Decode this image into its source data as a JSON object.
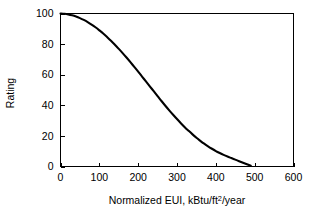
{
  "chart_data": {
    "type": "line",
    "title": "",
    "xlabel": "Normalized EUI, kBtu/ft2/year",
    "xlabel_main": "Normalized EUI, kBtu/ft",
    "xlabel_sup": "2",
    "xlabel_tail": "/year",
    "ylabel": "Rating",
    "xlim": [
      0,
      600
    ],
    "ylim": [
      0,
      100
    ],
    "xticks": [
      0,
      100,
      200,
      300,
      400,
      500,
      600
    ],
    "xtick_labels": [
      "0",
      "100",
      "200",
      "300",
      "400",
      "500",
      "600"
    ],
    "yticks": [
      0,
      20,
      40,
      60,
      80,
      100
    ],
    "ytick_labels": [
      "0",
      "20",
      "40",
      "60",
      "80",
      "100"
    ],
    "grid": false,
    "legend": false,
    "series": [
      {
        "name": "Rating vs Normalized EUI",
        "color": "#000000",
        "x": [
          0,
          10,
          20,
          30,
          40,
          50,
          60,
          70,
          80,
          90,
          100,
          110,
          120,
          130,
          140,
          150,
          160,
          170,
          180,
          190,
          200,
          210,
          220,
          230,
          240,
          250,
          260,
          270,
          280,
          290,
          300,
          310,
          320,
          330,
          340,
          350,
          360,
          370,
          380,
          390,
          400,
          410,
          420,
          430,
          440,
          450,
          460,
          470,
          480,
          490
        ],
        "values": [
          100,
          99.8,
          99.4,
          98.8,
          98.0,
          97.0,
          95.8,
          94.4,
          92.8,
          91.0,
          89.0,
          86.9,
          84.6,
          82.2,
          79.6,
          76.9,
          74.1,
          71.2,
          68.2,
          65.1,
          62.0,
          58.8,
          55.6,
          52.4,
          49.2,
          46.0,
          42.8,
          39.7,
          36.7,
          33.8,
          31.0,
          28.3,
          25.7,
          23.3,
          21.0,
          18.8,
          16.8,
          14.9,
          13.2,
          11.6,
          10.1,
          8.8,
          7.6,
          6.5,
          5.5,
          4.5,
          3.5,
          2.5,
          1.5,
          0.5
        ]
      }
    ],
    "annotations": []
  },
  "axes": {
    "y_axis_title": "Rating",
    "x_axis_title_parts": {
      "main": "Normalized EUI, kBtu/ft",
      "superscript": "2",
      "tail": "/year"
    }
  },
  "colors": {
    "background": "#ffffff",
    "axis": "#000000",
    "curve": "#000000",
    "text": "#000000"
  }
}
